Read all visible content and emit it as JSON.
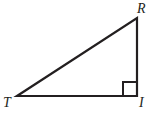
{
  "figure": {
    "kind": "right-triangle-diagram",
    "background_color": "#ffffff",
    "stroke_color": "#231f20",
    "stroke_width": 2.2,
    "label_color": "#231f20",
    "canvas": {
      "width": 163,
      "height": 119
    },
    "vertices": [
      {
        "name": "T",
        "label": "T",
        "x": 17,
        "y": 96,
        "label_x": 3,
        "label_y": 96
      },
      {
        "name": "I",
        "label": "I",
        "x": 137,
        "y": 96,
        "label_x": 139,
        "label_y": 96
      },
      {
        "name": "R",
        "label": "R",
        "x": 137,
        "y": 18,
        "label_x": 137,
        "label_y": 2
      }
    ],
    "sides": [
      {
        "name": "base-TI",
        "from": "T",
        "to": "I"
      },
      {
        "name": "leg-IR",
        "from": "I",
        "to": "R"
      },
      {
        "name": "hypotenuse-RT",
        "from": "R",
        "to": "T"
      }
    ],
    "right_angle": {
      "at_vertex": "I",
      "marker": "square",
      "size": 14,
      "x": 123,
      "y": 82
    }
  }
}
